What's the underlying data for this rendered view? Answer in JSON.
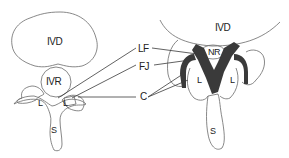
{
  "diagram": {
    "type": "anatomical-diagram",
    "left_panel": {
      "labels": {
        "disc": "IVD",
        "recess": "IVR",
        "lamina_left": "L",
        "lamina_right": "L",
        "spinous": "S"
      }
    },
    "right_panel": {
      "labels": {
        "disc": "IVD",
        "nerve_root": "NR",
        "lamina_left": "L",
        "lamina_right": "L",
        "spinous": "S"
      }
    },
    "callouts": [
      {
        "id": "lf",
        "text": "LF"
      },
      {
        "id": "fj",
        "text": "FJ"
      },
      {
        "id": "c",
        "text": "C"
      }
    ],
    "colors": {
      "outline": "#6a6a6a",
      "fill_dark": "#3a3a3a",
      "background": "#ffffff"
    }
  }
}
